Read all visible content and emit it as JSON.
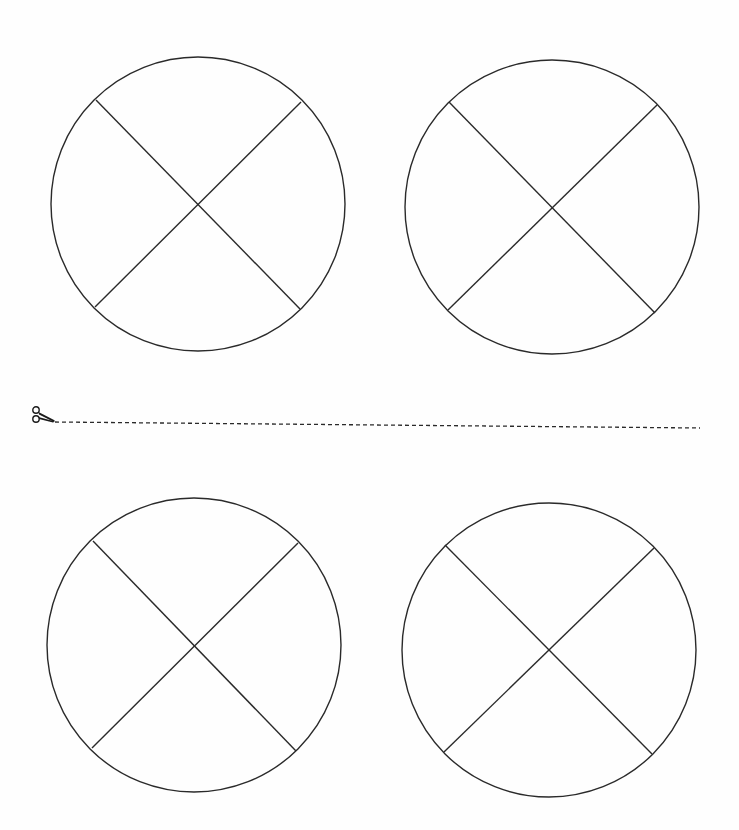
{
  "page": {
    "background": "#fefefe",
    "ink_color": "#2a2a2a",
    "bleed_through_text": [
      " ",
      " "
    ]
  },
  "circles": [
    {
      "id": "top-left",
      "cx": 198,
      "cy": 204,
      "r": 147,
      "lines": [
        [
          96,
          100,
          300,
          309
        ],
        [
          301,
          102,
          95,
          307
        ]
      ]
    },
    {
      "id": "top-right",
      "cx": 552,
      "cy": 207,
      "r": 147,
      "lines": [
        [
          449,
          102,
          655,
          313
        ],
        [
          657,
          105,
          448,
          310
        ]
      ]
    },
    {
      "id": "bottom-left",
      "cx": 194,
      "cy": 645,
      "r": 147,
      "lines": [
        [
          93,
          541,
          296,
          751
        ],
        [
          298,
          543,
          92,
          748
        ]
      ]
    },
    {
      "id": "bottom-right",
      "cx": 549,
      "cy": 650,
      "r": 147,
      "lines": [
        [
          445,
          545,
          652,
          754
        ],
        [
          654,
          548,
          444,
          752
        ]
      ]
    }
  ],
  "cut_line": {
    "icon": "scissors-icon",
    "x1": 55,
    "y1": 422,
    "x2": 700,
    "y2": 428,
    "dash": "4 3"
  }
}
